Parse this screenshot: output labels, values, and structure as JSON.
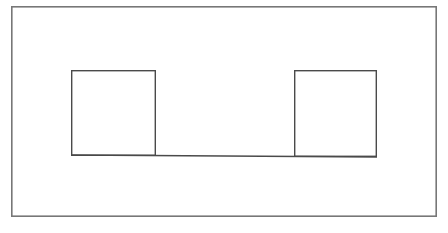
{
  "page": {
    "width": 448,
    "height": 233,
    "background_color": "#ffffff"
  },
  "style": {
    "line_color": "#4a4a4a",
    "outer_line_color": "#777777",
    "line_width": 1.4,
    "outer_line_width": 1.6,
    "fill_color": "none"
  },
  "diagram": {
    "shapes": [
      {
        "name": "outer-frame",
        "type": "rectangle",
        "x": 11,
        "y": 6,
        "width": 426,
        "height": 211,
        "stroke": "#777777",
        "stroke_width": 1.6
      },
      {
        "name": "left-square",
        "type": "rectangle",
        "x": 71,
        "y": 70,
        "width": 85,
        "height": 86,
        "stroke": "#4a4a4a",
        "stroke_width": 1.4
      },
      {
        "name": "right-square",
        "type": "rectangle",
        "x": 294,
        "y": 70,
        "width": 83,
        "height": 87,
        "stroke": "#4a4a4a",
        "stroke_width": 1.4
      },
      {
        "name": "baseline",
        "type": "line",
        "x1": 71,
        "y1": 155,
        "x2": 377,
        "y2": 157,
        "stroke": "#4a4a4a",
        "stroke_width": 1.4
      }
    ]
  },
  "labels": {
    "none_present": ""
  }
}
